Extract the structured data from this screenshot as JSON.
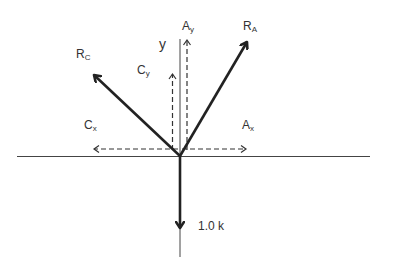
{
  "diagram": {
    "type": "free-body-diagram",
    "origin": [
      180,
      156
    ],
    "axes": {
      "y_label": "y"
    },
    "labels": {
      "RA_main": "R",
      "RA_sub": "A",
      "RC_main": "R",
      "RC_sub": "C",
      "Ay_main": "A",
      "Ay_sub": "y",
      "Cy_main": "C",
      "Cy_sub": "y",
      "Ax_main": "A",
      "Ax_sub": "x",
      "Cx_main": "C",
      "Cx_sub": "x",
      "load": "1.0 k"
    },
    "vectors": [
      {
        "name": "R_A",
        "style": "solid",
        "to": [
          249,
          39
        ]
      },
      {
        "name": "R_C",
        "style": "solid",
        "to": [
          92,
          73
        ]
      },
      {
        "name": "load",
        "style": "solid",
        "to": [
          180,
          230
        ],
        "magnitude": "1.0 k"
      },
      {
        "name": "A_y",
        "style": "dashed",
        "to": [
          187,
          39
        ]
      },
      {
        "name": "C_y",
        "style": "dashed",
        "to": [
          172,
          73
        ]
      },
      {
        "name": "A_x",
        "style": "dashed",
        "to": [
          247,
          149
        ]
      },
      {
        "name": "C_x",
        "style": "dashed",
        "to": [
          93,
          149
        ]
      }
    ],
    "colors": {
      "line": "#222222",
      "text": "#333333"
    }
  }
}
